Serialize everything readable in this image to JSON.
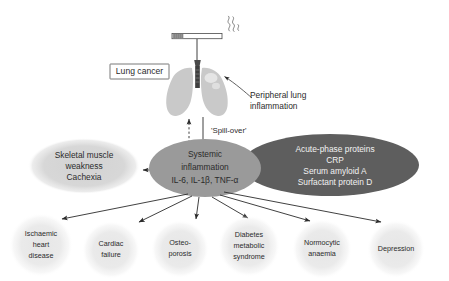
{
  "figure": {
    "background": "#ffffff"
  },
  "colors": {
    "central_ellipse": "#9a9a9a",
    "dark_ellipse": "#5e5e5e",
    "left_ellipse": "#d4d4d4",
    "bottom_circle": "#ececec",
    "lung": "#c9c9c9",
    "trachea": "#4a4a4a",
    "arrow": "#2b2b2b",
    "text": "#2b2b2b",
    "dark_ellipse_text": "#f2f2f2"
  },
  "top": {
    "cigarette": {
      "icon": "cigarette-icon",
      "smoke_icon": "smoke-wisp-icon"
    },
    "lungs": {
      "icon": "lungs-icon"
    },
    "lung_cancer_label": "Lung cancer",
    "peripheral_label_lines": [
      "Peripheral lung",
      "inflammation"
    ],
    "spill_over_label": "'Spill-over'"
  },
  "ellipses": {
    "central": {
      "name": "systemic-inflammation",
      "lines": [
        "Systemic",
        "inflammation",
        "IL-6, IL-1β, TNF-α"
      ]
    },
    "dark": {
      "name": "acute-phase-proteins",
      "lines": [
        "Acute-phase proteins",
        "CRP",
        "Serum amyloid A",
        "Surfactant protein D"
      ]
    },
    "left": {
      "name": "skeletal-muscle-weakness",
      "lines": [
        "Skeletal muscle",
        "weakness",
        "Cachexia"
      ]
    }
  },
  "outcomes": [
    {
      "name": "ischaemic-heart-disease",
      "lines": [
        "Ischaemic",
        "heart",
        "disease"
      ],
      "cx": 41,
      "cy": 245,
      "r": 32
    },
    {
      "name": "cardiac-failure",
      "lines": [
        "Cardiac",
        "failure"
      ],
      "cx": 111,
      "cy": 250,
      "r": 29
    },
    {
      "name": "osteoporosis",
      "lines": [
        "Osteo-",
        "porosis"
      ],
      "cx": 180,
      "cy": 249,
      "r": 29
    },
    {
      "name": "diabetes-metabolic-syndrome",
      "lines": [
        "Diabetes",
        "metabolic",
        "syndrome"
      ],
      "cx": 249,
      "cy": 246,
      "r": 31
    },
    {
      "name": "normocytic-anaemia",
      "lines": [
        "Normocytic",
        "anaemia"
      ],
      "cx": 322,
      "cy": 249,
      "r": 30
    },
    {
      "name": "depression",
      "lines": [
        "Depression"
      ],
      "cx": 396,
      "cy": 249,
      "r": 29
    }
  ]
}
